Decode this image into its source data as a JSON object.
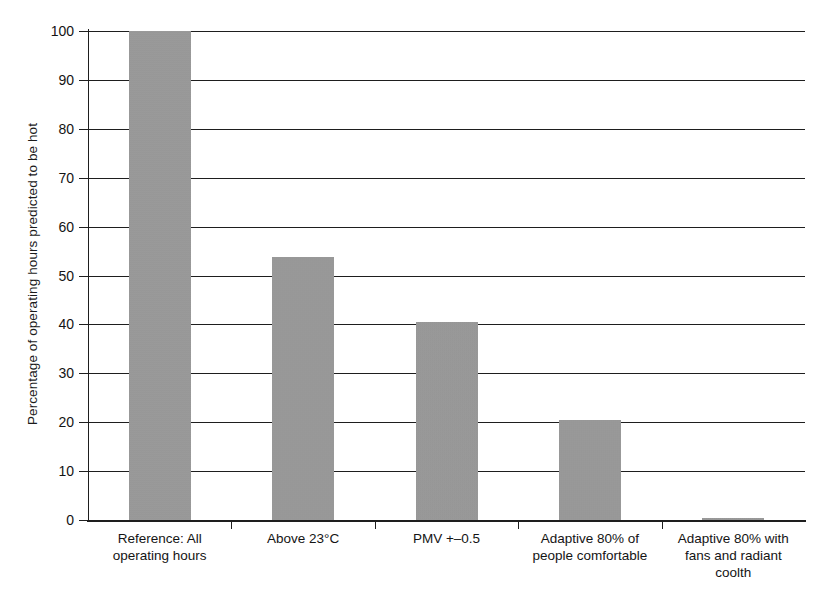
{
  "chart_data": {
    "type": "bar",
    "title": "",
    "xlabel": "",
    "ylabel": "Percentage of operating hours predicted to be hot",
    "ylim": [
      0,
      100
    ],
    "ytick_step": 10,
    "grid": true,
    "legend": "none",
    "bar_color": "#999999",
    "axis_color": "#1e1e1e",
    "categories": [
      "Reference: All operating hours",
      "Above 23°C",
      "PMV +–0.5",
      "Adaptive 80% of people comfortable",
      "Adaptive 80% with fans and radiant coolth"
    ],
    "category_lines": [
      [
        "Reference: All",
        "operating hours"
      ],
      [
        "Above 23°C"
      ],
      [
        "PMV +–0.5"
      ],
      [
        "Adaptive 80% of",
        "people comfortable"
      ],
      [
        "Adaptive 80% with",
        "fans and radiant",
        "coolth"
      ]
    ],
    "values": [
      100,
      53.8,
      40.5,
      20.5,
      0.5
    ],
    "ytick_labels": [
      "100",
      "90",
      "80",
      "70",
      "60",
      "50",
      "40",
      "30",
      "20",
      "10",
      "0"
    ],
    "ytick_values": [
      100,
      90,
      80,
      70,
      60,
      50,
      40,
      30,
      20,
      10,
      0
    ]
  }
}
